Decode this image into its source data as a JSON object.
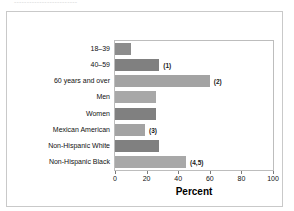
{
  "top_text": {
    "faded_line": "-------------------------"
  },
  "chart_data": {
    "type": "bar",
    "orientation": "horizontal",
    "title": "",
    "xlabel": "Percent",
    "ylabel": "",
    "xlim": [
      0,
      100
    ],
    "xticks": [
      0,
      20,
      40,
      60,
      80,
      100
    ],
    "grid": false,
    "legend": "none",
    "categories": [
      "18–39",
      "40–59",
      "60 years and over",
      "Men",
      "Women",
      "Mexican American",
      "Non-Hispanic White",
      "Non-Hispanic Black"
    ],
    "values": [
      10,
      28,
      60,
      26,
      26,
      19,
      28,
      45
    ],
    "annotations": [
      "",
      "(1)",
      "(2)",
      "",
      "",
      "(3)",
      "",
      "(4,5)"
    ],
    "bar_colors": [
      "#8c8c8c",
      "#808080",
      "#a3a3a3",
      "#a8a8a8",
      "#808080",
      "#a3a3a3",
      "#808080",
      "#a8a8a8"
    ]
  },
  "axis": {
    "tick_0": "0",
    "tick_20": "20",
    "tick_40": "40",
    "tick_60": "60",
    "tick_80": "80",
    "tick_100": "100"
  }
}
